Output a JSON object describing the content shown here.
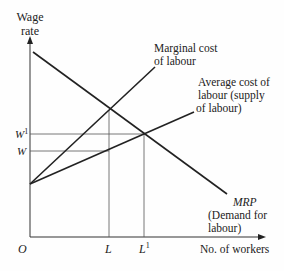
{
  "diagram": {
    "type": "monopsony-labour-market",
    "y_axis": {
      "label_line1": "Wage",
      "label_line2": "rate"
    },
    "x_axis": {
      "label": "No. of workers"
    },
    "origin_label": "O",
    "wage_levels": [
      {
        "label": "W",
        "sup": "1",
        "name": "w1"
      },
      {
        "label": "W",
        "sup": "",
        "name": "w"
      }
    ],
    "quantity_levels": [
      {
        "label": "L",
        "sup": "",
        "name": "l"
      },
      {
        "label": "L",
        "sup": "1",
        "name": "l1"
      }
    ],
    "curves": {
      "mcl": {
        "line1": "Marginal cost",
        "line2": "of labour"
      },
      "acl": {
        "line1": "Average cost of",
        "line2": "labour (supply",
        "line3": "of labour)"
      },
      "mrp": {
        "line1": "MRP",
        "line2": "(Demand for",
        "line3": "labour)"
      }
    },
    "line_color": "#222222",
    "guide_color": "#555555"
  }
}
